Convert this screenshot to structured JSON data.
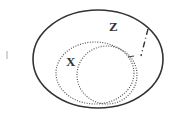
{
  "diagram": {
    "type": "venn",
    "outer_set": {
      "label": "Z",
      "style": "solid"
    },
    "inner_sets": [
      {
        "label": "X",
        "style": "dotted"
      },
      {
        "label": "",
        "style": "dotted"
      }
    ],
    "annotation": {
      "style": "dashed",
      "label": "I"
    }
  },
  "colors": {
    "stroke": "#333333",
    "background": "#ffffff"
  }
}
